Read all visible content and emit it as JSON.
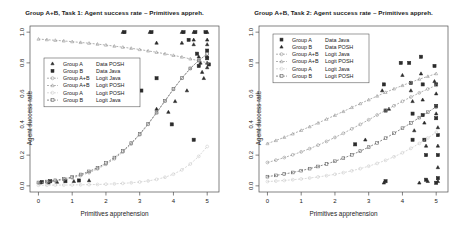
{
  "figure": {
    "axis_label_x": "Primitives apprehension",
    "axis_label_y": "Agent success rate",
    "panels": [
      {
        "title": "Group A+B, Task 1: Agent success rate ~ Primitives appreh.",
        "legend": [
          {
            "label_left": "Group A",
            "label_right": "Data POSH",
            "symbol": "triangle",
            "line": false,
            "color": "#2b2b2b"
          },
          {
            "label_left": "Group B",
            "label_right": "Data Java",
            "symbol": "square",
            "line": false,
            "color": "#2b2b2b"
          },
          {
            "label_left": "Group A+B",
            "label_right": "Logit Java",
            "symbol": "circle",
            "line": true,
            "color": "#8f8f8f"
          },
          {
            "label_left": "Group A+B",
            "label_right": "Logit POSH",
            "symbol": "triangle",
            "line": true,
            "color": "#8f8f8f"
          },
          {
            "label_left": "Group A",
            "label_right": "Logit POSH",
            "symbol": "circle",
            "line": true,
            "color": "#c9c9c9"
          },
          {
            "label_left": "Group B",
            "label_right": "Logit Java",
            "symbol": "square",
            "line": true,
            "color": "#5a5a5a"
          }
        ]
      },
      {
        "title": "Group A+B, Task 2: Agent success rate ~ Primitives appreh.",
        "legend": [
          {
            "label_left": "Group A",
            "label_right": "Data Java",
            "symbol": "square",
            "line": false,
            "color": "#2b2b2b"
          },
          {
            "label_left": "Group B",
            "label_right": "Data POSH",
            "symbol": "triangle",
            "line": false,
            "color": "#2b2b2b"
          },
          {
            "label_left": "Group A+B",
            "label_right": "Logit Java",
            "symbol": "circle",
            "line": true,
            "color": "#8f8f8f"
          },
          {
            "label_left": "Group A+B",
            "label_right": "Logit POSH",
            "symbol": "triangle",
            "line": true,
            "color": "#8f8f8f"
          },
          {
            "label_left": "Group A",
            "label_right": "Logit Java",
            "symbol": "circle",
            "line": true,
            "color": "#c9c9c9"
          },
          {
            "label_left": "Group B",
            "label_right": "Logit POSH",
            "symbol": "square",
            "line": true,
            "color": "#5a5a5a"
          }
        ]
      }
    ]
  },
  "chart_data": [
    {
      "type": "scatter",
      "title": "Group A+B, Task 1: Agent success rate ~ Primitives appreh.",
      "xlabel": "Primitives apprehension",
      "ylabel": "Agent success rate",
      "xlim": [
        -0.25,
        5.35
      ],
      "ylim": [
        -0.04,
        1.04
      ],
      "xticks": [
        0,
        1,
        2,
        3,
        4,
        5
      ],
      "yticks": [
        0.0,
        0.2,
        0.4,
        0.6,
        0.8,
        1.0
      ],
      "ytick_labels": [
        "0.0",
        "0.2",
        "0.4",
        "0.6",
        "0.8",
        "1.0"
      ],
      "grid": false,
      "legend_position": "left-upper",
      "x": [
        0,
        0.25,
        0.5,
        0.75,
        1,
        1.25,
        1.5,
        1.75,
        2,
        2.25,
        2.5,
        2.75,
        3,
        3.25,
        3.5,
        3.75,
        4,
        4.25,
        4.5,
        4.75,
        5
      ],
      "series": [
        {
          "name": "Group A+B Logit POSH",
          "kind": "line",
          "color": "#8f8f8f",
          "symbol": "triangle",
          "values": [
            0.955,
            0.951,
            0.947,
            0.943,
            0.938,
            0.933,
            0.928,
            0.922,
            0.916,
            0.909,
            0.902,
            0.895,
            0.887,
            0.878,
            0.869,
            0.859,
            0.849,
            0.838,
            0.826,
            0.814,
            0.801
          ]
        },
        {
          "name": "Group B Logit Java",
          "kind": "line",
          "color": "#5a5a5a",
          "symbol": "square",
          "values": [
            0.022,
            0.028,
            0.036,
            0.046,
            0.058,
            0.074,
            0.094,
            0.118,
            0.148,
            0.184,
            0.227,
            0.278,
            0.337,
            0.404,
            0.477,
            0.554,
            0.63,
            0.701,
            0.764,
            0.816,
            0.858
          ]
        },
        {
          "name": "Group A+B Logit Java",
          "kind": "line",
          "color": "#8f8f8f",
          "symbol": "circle",
          "values": [
            0.018,
            0.024,
            0.031,
            0.04,
            0.052,
            0.067,
            0.086,
            0.11,
            0.14,
            0.176,
            0.22,
            0.272,
            0.332,
            0.4,
            0.474,
            0.551,
            0.628,
            0.7,
            0.763,
            0.816,
            0.858
          ]
        },
        {
          "name": "Group A Logit POSH",
          "kind": "line",
          "color": "#c9c9c9",
          "symbol": "circle",
          "values": [
            0.004,
            0.004,
            0.005,
            0.005,
            0.006,
            0.007,
            0.008,
            0.009,
            0.011,
            0.013,
            0.016,
            0.02,
            0.025,
            0.032,
            0.042,
            0.056,
            0.076,
            0.104,
            0.142,
            0.192,
            0.256
          ]
        },
        {
          "name": "Group A Data POSH",
          "kind": "scatter",
          "color": "#2b2b2b",
          "symbol": "triangle",
          "points": [
            [
              0.05,
              0.02
            ],
            [
              0.3,
              0.02
            ],
            [
              0.55,
              0.025
            ],
            [
              1.05,
              0.03
            ],
            [
              1.5,
              0.035
            ],
            [
              2.5,
              1.0
            ],
            [
              3.3,
              1.0
            ],
            [
              3.5,
              0.93
            ],
            [
              3.5,
              0.5
            ],
            [
              4.25,
              1.0
            ],
            [
              4.25,
              0.93
            ],
            [
              4.6,
              1.0
            ],
            [
              4.6,
              0.95
            ],
            [
              4.6,
              0.92
            ],
            [
              4.75,
              0.84
            ],
            [
              4.8,
              0.8
            ],
            [
              4.85,
              0.74
            ],
            [
              4.9,
              0.7
            ],
            [
              5.0,
              1.0
            ],
            [
              5.0,
              0.95
            ],
            [
              5.0,
              0.92
            ],
            [
              5.0,
              0.84
            ],
            [
              5.0,
              0.8
            ],
            [
              5.0,
              0.77
            ],
            [
              4.4,
              0.62
            ],
            [
              4.05,
              0.55
            ],
            [
              3.85,
              0.48
            ]
          ]
        },
        {
          "name": "Group B Data Java",
          "kind": "scatter",
          "color": "#2b2b2b",
          "symbol": "square",
          "points": [
            [
              0.1,
              0.025
            ],
            [
              0.35,
              0.03
            ],
            [
              0.8,
              0.03
            ],
            [
              1.2,
              0.035
            ],
            [
              2.55,
              1.0
            ],
            [
              3.05,
              0.62
            ],
            [
              3.35,
              1.0
            ],
            [
              3.5,
              0.7
            ],
            [
              4.3,
              1.0
            ],
            [
              4.45,
              0.95
            ],
            [
              4.65,
              1.0
            ],
            [
              4.7,
              0.86
            ],
            [
              4.75,
              0.78
            ],
            [
              4.95,
              1.0
            ],
            [
              5.0,
              0.88
            ],
            [
              5.0,
              0.83
            ],
            [
              5.05,
              0.79
            ],
            [
              3.95,
              0.4
            ],
            [
              4.6,
              0.3
            ]
          ]
        }
      ]
    },
    {
      "type": "scatter",
      "title": "Group A+B, Task 2: Agent success rate ~ Primitives appreh.",
      "xlabel": "Primitives apprehension",
      "ylabel": "Agent success rate",
      "xlim": [
        -0.25,
        5.35
      ],
      "ylim": [
        -0.04,
        1.04
      ],
      "xticks": [
        0,
        1,
        2,
        3,
        4,
        5
      ],
      "yticks": [
        0.0,
        0.2,
        0.4,
        0.6,
        0.8,
        1.0
      ],
      "ytick_labels": [
        "0.0",
        "0.2",
        "0.4",
        "0.6",
        "0.8",
        "1.0"
      ],
      "grid": false,
      "legend_position": "left-upper",
      "x": [
        0,
        0.25,
        0.5,
        0.75,
        1,
        1.25,
        1.5,
        1.75,
        2,
        2.25,
        2.5,
        2.75,
        3,
        3.25,
        3.5,
        3.75,
        4,
        4.25,
        4.5,
        4.75,
        5
      ],
      "series": [
        {
          "name": "Group A+B Logit POSH",
          "kind": "line",
          "color": "#8f8f8f",
          "symbol": "triangle",
          "values": [
            0.275,
            0.295,
            0.316,
            0.338,
            0.361,
            0.385,
            0.409,
            0.434,
            0.459,
            0.484,
            0.51,
            0.535,
            0.56,
            0.584,
            0.608,
            0.631,
            0.653,
            0.674,
            0.694,
            0.712,
            0.73
          ]
        },
        {
          "name": "Group A+B Logit Java",
          "kind": "line",
          "color": "#8f8f8f",
          "symbol": "circle",
          "values": [
            0.152,
            0.167,
            0.184,
            0.202,
            0.221,
            0.242,
            0.265,
            0.289,
            0.315,
            0.342,
            0.371,
            0.4,
            0.43,
            0.461,
            0.491,
            0.521,
            0.55,
            0.578,
            0.605,
            0.63,
            0.654
          ]
        },
        {
          "name": "Group B Logit POSH",
          "kind": "line",
          "color": "#5a5a5a",
          "symbol": "square",
          "values": [
            0.06,
            0.068,
            0.077,
            0.087,
            0.099,
            0.112,
            0.126,
            0.142,
            0.16,
            0.18,
            0.202,
            0.226,
            0.252,
            0.28,
            0.31,
            0.342,
            0.375,
            0.409,
            0.444,
            0.479,
            0.514
          ]
        },
        {
          "name": "Group A Logit Java",
          "kind": "line",
          "color": "#c9c9c9",
          "symbol": "circle",
          "values": [
            0.028,
            0.031,
            0.035,
            0.04,
            0.045,
            0.051,
            0.058,
            0.066,
            0.075,
            0.086,
            0.098,
            0.112,
            0.128,
            0.146,
            0.166,
            0.189,
            0.215,
            0.244,
            0.276,
            0.311,
            0.349
          ]
        },
        {
          "name": "Group A Data Java",
          "kind": "scatter",
          "color": "#2b2b2b",
          "symbol": "square",
          "points": [
            [
              3.45,
              0.66
            ],
            [
              3.5,
              0.49
            ],
            [
              3.95,
              0.8
            ],
            [
              4.2,
              0.8
            ],
            [
              4.25,
              0.67
            ],
            [
              4.3,
              0.47
            ],
            [
              4.3,
              0.3
            ],
            [
              4.55,
              0.84
            ],
            [
              4.6,
              0.66
            ],
            [
              4.6,
              0.46
            ],
            [
              4.65,
              0.3
            ],
            [
              4.7,
              0.2
            ],
            [
              4.95,
              0.78
            ],
            [
              5.0,
              0.66
            ],
            [
              5.0,
              0.52
            ],
            [
              5.0,
              0.44
            ],
            [
              5.05,
              0.33
            ],
            [
              5.05,
              0.2
            ],
            [
              5.05,
              0.05
            ],
            [
              4.7,
              0.04
            ],
            [
              5.0,
              0.02
            ],
            [
              3.5,
              0.03
            ],
            [
              2.6,
              0.27
            ]
          ]
        },
        {
          "name": "Group B Data POSH",
          "kind": "scatter",
          "color": "#2b2b2b",
          "symbol": "triangle",
          "points": [
            [
              3.4,
              0.62
            ],
            [
              3.6,
              0.5
            ],
            [
              4.0,
              0.72
            ],
            [
              4.25,
              0.62
            ],
            [
              4.3,
              0.55
            ],
            [
              4.35,
              0.36
            ],
            [
              4.55,
              0.73
            ],
            [
              4.6,
              0.56
            ],
            [
              4.65,
              0.41
            ],
            [
              4.7,
              0.26
            ],
            [
              4.95,
              0.68
            ],
            [
              5.0,
              0.6
            ],
            [
              5.0,
              0.47
            ],
            [
              5.05,
              0.38
            ],
            [
              5.05,
              0.26
            ],
            [
              5.05,
              0.12
            ],
            [
              5.05,
              0.03
            ],
            [
              4.75,
              0.03
            ],
            [
              4.5,
              0.02
            ],
            [
              3.45,
              0.02
            ],
            [
              2.9,
              0.3
            ]
          ]
        }
      ]
    }
  ]
}
